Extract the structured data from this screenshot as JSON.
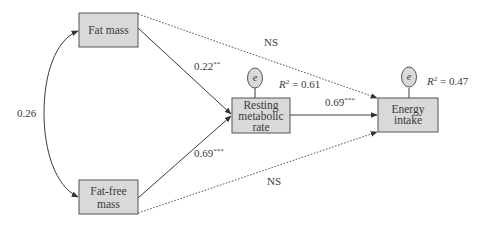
{
  "diagram": {
    "type": "path-model",
    "nodes": {
      "fat_mass": {
        "label_lines": [
          "Fat mass"
        ]
      },
      "fat_free_mass": {
        "label_lines": [
          "Fat-free",
          "mass"
        ]
      },
      "rmr": {
        "label_lines": [
          "Resting",
          "metabolic",
          "rate"
        ]
      },
      "energy_intake": {
        "label_lines": [
          "Energy",
          "intake"
        ]
      }
    },
    "error_terms": {
      "rmr_error": {
        "symbol": "e",
        "r2_label": "R",
        "r2_sup": "2",
        "r2_value": " = 0.61"
      },
      "ei_error": {
        "symbol": "e",
        "r2_label": "R",
        "r2_sup": "2",
        "r2_value": " = 0.47"
      }
    },
    "paths": {
      "covariance_fm_ffm": {
        "value": "0.26",
        "style": "curved double-headed"
      },
      "fm_to_rmr": {
        "value": "0.22",
        "sig": "**",
        "style": "solid"
      },
      "ffm_to_rmr": {
        "value": "0.69",
        "sig": "***",
        "style": "solid"
      },
      "rmr_to_ei": {
        "value": "0.69",
        "sig": "***",
        "style": "solid"
      },
      "fm_to_ei": {
        "value": "NS",
        "style": "dotted"
      },
      "ffm_to_ei": {
        "value": "NS",
        "style": "dotted"
      }
    }
  }
}
